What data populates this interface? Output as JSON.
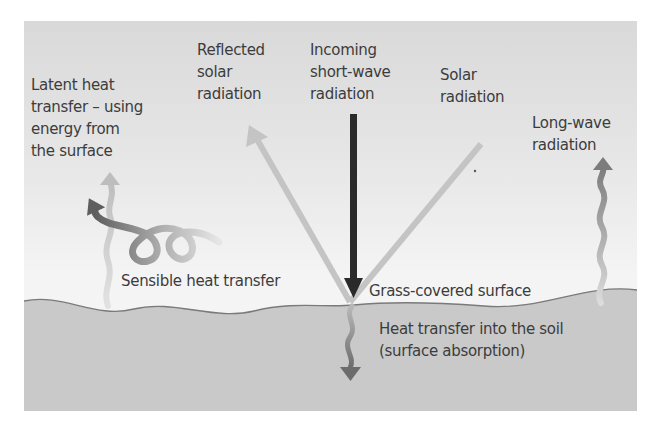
{
  "diagram": {
    "labels": {
      "latent_heat": [
        "Latent heat",
        "transfer – using",
        "energy from",
        "the surface"
      ],
      "reflected_solar": [
        "Reflected",
        "solar",
        "radiation"
      ],
      "incoming_short_wave": [
        "Incoming",
        "short-wave",
        "radiation"
      ],
      "solar_radiation": [
        "Solar",
        "radiation"
      ],
      "long_wave": [
        "Long-wave",
        "radiation"
      ],
      "sensible_heat": "Sensible heat transfer",
      "grass_surface": "Grass-covered surface",
      "soil_transfer": [
        "Heat transfer into the soil",
        "(surface absorption)"
      ]
    },
    "colors": {
      "incoming_arrow": "#2a2a2a",
      "reflected_arrow": "#c4c4c4",
      "sensible_dark": "#6e6e6e",
      "sensible_light": "#b4b4b4",
      "long_wave_arrow": "#8a8a8a",
      "soil": "#c9c9c9",
      "surface_line": "#7a7a7a",
      "text": "#3c3c3c"
    }
  }
}
